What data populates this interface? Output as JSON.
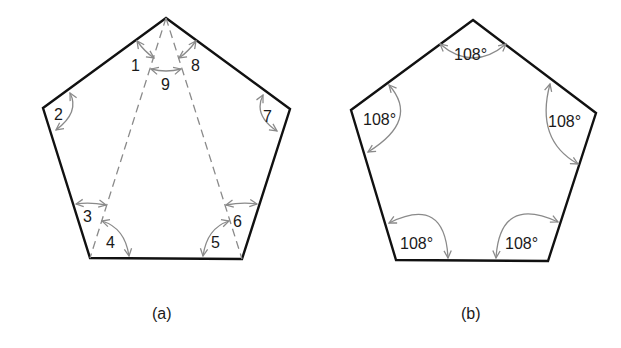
{
  "figure": {
    "colors": {
      "edge": "#111111",
      "annotation": "#8a8a8a",
      "text": "#1a1a1a",
      "background": "#ffffff"
    },
    "panel_a": {
      "caption": "(a)",
      "shape": "regular pentagon divided into three triangles by two diagonals from the top vertex",
      "angle_labels": [
        "1",
        "2",
        "3",
        "4",
        "5",
        "6",
        "7",
        "8",
        "9"
      ]
    },
    "panel_b": {
      "caption": "(b)",
      "shape": "regular pentagon with each interior angle marked",
      "angle_labels": [
        "108°",
        "108°",
        "108°",
        "108°",
        "108°"
      ]
    }
  }
}
